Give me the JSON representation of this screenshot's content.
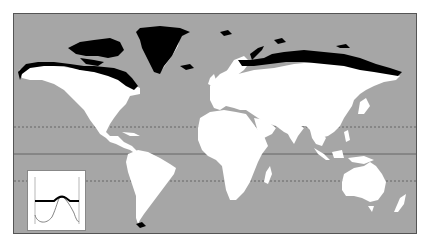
{
  "map": {
    "type": "world-map-distribution",
    "projection": "equirectangular-like",
    "colors": {
      "ocean": "#a6a6a6",
      "land": "#ffffff",
      "distribution": "#000000",
      "frame": "#555555",
      "reference_lines": "#555555"
    },
    "reference_lines": [
      {
        "name": "tropic-of-cancer",
        "style": "dashed"
      },
      {
        "name": "equator",
        "style": "solid"
      },
      {
        "name": "tropic-of-capricorn",
        "style": "dashed"
      }
    ],
    "highlighted_regions": [
      "Alaska coast",
      "Canadian Arctic Archipelago",
      "Northern Canada coast",
      "Greenland coast",
      "Iceland",
      "Svalbard",
      "Novaya Zemlya",
      "Northern Russia / Siberia coast",
      "Tierra del Fuego"
    ]
  },
  "inset": {
    "type": "latitude-profile",
    "curves": [
      {
        "name": "thick-black-band",
        "style": "thick",
        "color": "#000000"
      },
      {
        "name": "thin-grey-curve",
        "style": "thin",
        "color": "#666666"
      }
    ]
  }
}
